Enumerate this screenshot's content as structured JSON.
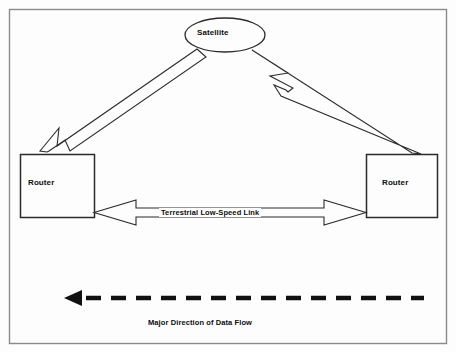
{
  "diagram": {
    "frame": {
      "stroke": "#8a8a8a",
      "fill": "#fdfdfd"
    },
    "nodes": [
      {
        "id": "satellite",
        "label": "Satellite",
        "shape": "ellipse",
        "cx": 225,
        "cy": 35,
        "rx": 40,
        "ry": 17
      },
      {
        "id": "router-left",
        "label": "Router",
        "shape": "rect",
        "x": 20,
        "y": 154,
        "width": 74,
        "height": 64
      },
      {
        "id": "router-right",
        "label": "Router",
        "shape": "rect",
        "x": 366,
        "y": 154,
        "width": 72,
        "height": 64
      }
    ],
    "edges": [
      {
        "id": "satellite-to-router-left",
        "label": "",
        "style": "hollow-block-arrow",
        "direction": "down-left",
        "from": "satellite",
        "to": "router-left"
      },
      {
        "id": "router-right-to-satellite",
        "label": "",
        "style": "hollow-block-arrow",
        "direction": "up-left",
        "from": "router-right",
        "to": "satellite"
      },
      {
        "id": "terrestrial-link",
        "label": "Terrestrial Low-Speed Link",
        "style": "hollow-double-arrow",
        "direction": "bidirectional",
        "from": "router-left",
        "to": "router-right"
      }
    ],
    "annotations": [
      {
        "id": "data-flow-arrow",
        "caption": "Major Direction of Data Flow",
        "style": "dashed-solid-arrow",
        "direction": "left",
        "color": "#111111",
        "dash_count": 12
      }
    ],
    "colors": {
      "line": "#2b2b2b",
      "frame": "#8a8a8a",
      "text": "#0d0d0d",
      "background": "#fdfdfd",
      "flow_arrow": "#111111"
    }
  }
}
